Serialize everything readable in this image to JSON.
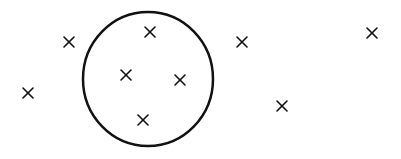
{
  "diagram": {
    "stroke_color": "#111111",
    "background": "#ffffff",
    "circle": {
      "cx": 148,
      "cy": 79,
      "rx": 65,
      "ry": 67,
      "stroke_width": 2.5
    },
    "marker_size": 5,
    "marker_stroke_width": 1.6,
    "points": [
      {
        "x": 69,
        "y": 42,
        "inside": false
      },
      {
        "x": 28,
        "y": 93,
        "inside": false
      },
      {
        "x": 150,
        "y": 32,
        "inside": true
      },
      {
        "x": 126,
        "y": 75,
        "inside": true
      },
      {
        "x": 180,
        "y": 80,
        "inside": true
      },
      {
        "x": 143,
        "y": 120,
        "inside": true
      },
      {
        "x": 242,
        "y": 42,
        "inside": false
      },
      {
        "x": 282,
        "y": 106,
        "inside": false
      },
      {
        "x": 372,
        "y": 33,
        "inside": false
      }
    ]
  }
}
